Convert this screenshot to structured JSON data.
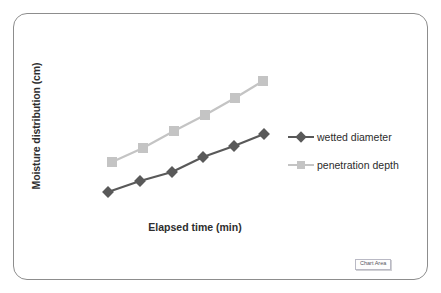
{
  "chart_data": {
    "type": "line",
    "title": "",
    "xlabel": "Elapsed time (min)",
    "ylabel": "Moisture distribution (cm)",
    "grid": false,
    "legend_position": "right",
    "axis_ticks_shown": false,
    "x": [
      1,
      2,
      3,
      4,
      5,
      6
    ],
    "series": [
      {
        "name": "wetted diameter",
        "color": "#595959",
        "marker": "diamond",
        "values": [
          10.5,
          14.0,
          17.5,
          22.0,
          25.5,
          29.5
        ],
        "pixel_points": [
          {
            "x": 108,
            "y": 192
          },
          {
            "x": 140,
            "y": 181
          },
          {
            "x": 172,
            "y": 172
          },
          {
            "x": 203,
            "y": 157
          },
          {
            "x": 234,
            "y": 146
          },
          {
            "x": 264,
            "y": 134
          }
        ]
      },
      {
        "name": "penetration depth",
        "color": "#c4c4c4",
        "marker": "square",
        "values": [
          21.0,
          25.5,
          30.0,
          34.5,
          39.5,
          44.0
        ],
        "pixel_points": [
          {
            "x": 112,
            "y": 162
          },
          {
            "x": 143,
            "y": 148
          },
          {
            "x": 174,
            "y": 131
          },
          {
            "x": 205,
            "y": 115
          },
          {
            "x": 235,
            "y": 98
          },
          {
            "x": 263,
            "y": 81
          }
        ]
      }
    ]
  },
  "axis": {
    "y_title": "Moisture distribution (cm)",
    "x_title": "Elapsed time (min)"
  },
  "legend": {
    "items": [
      {
        "label": "wetted diameter",
        "color": "#595959",
        "marker": "diamond"
      },
      {
        "label": "penetration depth",
        "color": "#c4c4c4",
        "marker": "square"
      }
    ]
  },
  "tooltip": {
    "chart_area_label": "Chart Area"
  },
  "colors": {
    "frame_border": "#8d8d8d",
    "background": "#ffffff",
    "series_dark": "#595959",
    "series_light": "#c4c4c4",
    "text": "#2e2e2e"
  }
}
